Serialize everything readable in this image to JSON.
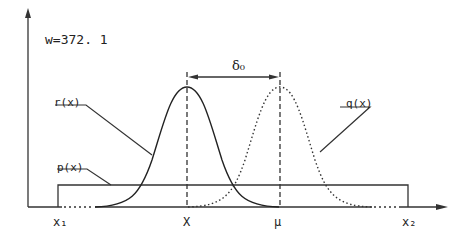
{
  "diagram": {
    "annotation_w": "w=372. 1",
    "curves": [
      {
        "name": "r(x)",
        "label": "r(x)",
        "style": "solid",
        "peak_at": "X"
      },
      {
        "name": "q(x)",
        "label": "q(x)",
        "style": "dotted",
        "peak_at": "μ"
      },
      {
        "name": "p(x)",
        "label": "p(x)",
        "style": "solid-rectangle",
        "range": [
          "x1",
          "x2"
        ]
      }
    ],
    "offset_label": "δ0",
    "x_axis_labels": {
      "x1": "x1",
      "X": "X",
      "mu": "μ",
      "x2": "x2"
    }
  },
  "labels": {
    "w": "w=372. 1",
    "r": "r(x)",
    "q": "q(x)",
    "p": "p(x)",
    "delta": "δ₀",
    "x1": "x₁",
    "X": "X",
    "mu": "μ",
    "x2": "x₂"
  }
}
